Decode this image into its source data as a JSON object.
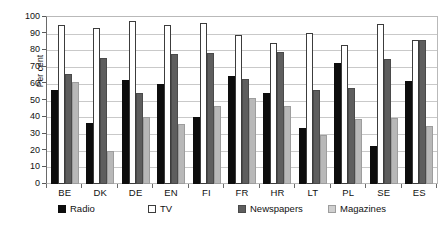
{
  "chart_data": {
    "type": "bar",
    "title": "",
    "xlabel": "",
    "ylabel": "Per cent",
    "ylim": [
      0,
      100
    ],
    "yticks": [
      0,
      10,
      20,
      30,
      40,
      50,
      60,
      70,
      80,
      90,
      100
    ],
    "grid": true,
    "legend_position": "bottom",
    "categories": [
      "BE",
      "DK",
      "DE",
      "EN",
      "FI",
      "FR",
      "HR",
      "LT",
      "PL",
      "SE",
      "ES"
    ],
    "series": [
      {
        "name": "Radio",
        "color": "#0d0d0d",
        "values": [
          56,
          36.5,
          62.5,
          60,
          40,
          64.5,
          54.5,
          33.5,
          72.5,
          23,
          61.5
        ]
      },
      {
        "name": "TV",
        "color": "#ffffff",
        "values": [
          95.5,
          93.5,
          97.5,
          95.5,
          96.5,
          89.5,
          84.5,
          90.5,
          83.5,
          96,
          86
        ]
      },
      {
        "name": "Newspapers",
        "color": "#5e5e5e",
        "values": [
          66,
          75.5,
          54.5,
          78,
          78.5,
          63,
          79,
          56,
          57.5,
          75,
          86
        ]
      },
      {
        "name": "Magazines",
        "color": "#b8b8b8",
        "values": [
          61,
          19.5,
          40,
          36,
          46.5,
          51.5,
          47,
          29.5,
          39,
          39.5,
          34.5
        ]
      }
    ]
  },
  "axis": {
    "y_title": "Per cent"
  }
}
